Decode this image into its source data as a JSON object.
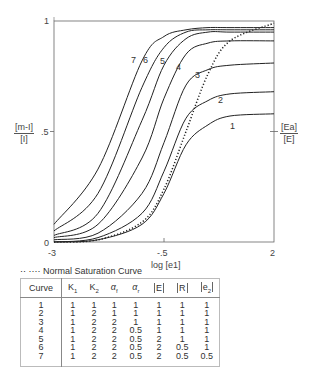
{
  "chart_data": {
    "type": "line",
    "title": "",
    "xlabel": "log [e1]",
    "ylabel_left": "[m-I] / [I]",
    "ylabel_right": "[Ea] / [E]",
    "xlim": [
      -3,
      2
    ],
    "ylim": [
      0,
      1
    ],
    "x_ticks": [
      "-3",
      "-.5",
      "2"
    ],
    "y_ticks": [
      "0",
      ".5",
      "1"
    ],
    "grid": false,
    "legend": {
      "position": "below",
      "entries": [
        "Normal Saturation Curve"
      ]
    },
    "series": [
      {
        "name": "1",
        "style": "solid",
        "x": [
          -3,
          -2,
          -1,
          -0.5,
          0,
          0.5,
          1,
          2
        ],
        "y": [
          0.0,
          0.01,
          0.08,
          0.22,
          0.44,
          0.53,
          0.57,
          0.58
        ]
      },
      {
        "name": "2",
        "style": "solid",
        "x": [
          -3,
          -2,
          -1,
          -0.5,
          0,
          0.5,
          1,
          2
        ],
        "y": [
          0.0,
          0.02,
          0.13,
          0.32,
          0.56,
          0.64,
          0.67,
          0.68
        ]
      },
      {
        "name": "3",
        "style": "solid",
        "x": [
          -3,
          -2,
          -1,
          -0.5,
          0,
          0.5,
          1,
          2
        ],
        "y": [
          0.01,
          0.04,
          0.22,
          0.45,
          0.71,
          0.78,
          0.8,
          0.81
        ]
      },
      {
        "name": "4",
        "style": "solid",
        "x": [
          -3,
          -2,
          -1,
          -0.5,
          0,
          0.5,
          1,
          2
        ],
        "y": [
          0.02,
          0.08,
          0.38,
          0.65,
          0.85,
          0.9,
          0.91,
          0.91
        ]
      },
      {
        "name": "5",
        "style": "solid",
        "x": [
          -3,
          -2,
          -1,
          -0.5,
          0,
          0.5,
          1,
          2
        ],
        "y": [
          0.03,
          0.13,
          0.55,
          0.8,
          0.92,
          0.95,
          0.95,
          0.95
        ]
      },
      {
        "name": "6",
        "style": "solid",
        "x": [
          -3,
          -2,
          -1,
          -0.5,
          0,
          0.5,
          1,
          2
        ],
        "y": [
          0.05,
          0.22,
          0.7,
          0.88,
          0.95,
          0.96,
          0.96,
          0.96
        ]
      },
      {
        "name": "7",
        "style": "solid",
        "x": [
          -3,
          -2,
          -1,
          -0.5,
          0,
          0.5,
          1,
          2
        ],
        "y": [
          0.08,
          0.33,
          0.82,
          0.93,
          0.96,
          0.97,
          0.97,
          0.97
        ]
      },
      {
        "name": "Normal Saturation Curve",
        "style": "dotted",
        "x": [
          -3,
          -2,
          -1,
          -0.5,
          0,
          0.5,
          1,
          2
        ],
        "y": [
          0.0,
          0.01,
          0.09,
          0.24,
          0.5,
          0.76,
          0.91,
          0.99
        ]
      }
    ],
    "curve_labels": [
      "1",
      "2",
      "3",
      "4",
      "5",
      "6",
      "7"
    ]
  },
  "axes": {
    "y_left_num": "[m-I]",
    "y_left_den": "[I]",
    "y_right_num": "[Ea]",
    "y_right_den": "[E]",
    "x_label": "log [e1]",
    "y_tick_0": "0",
    "y_tick_05": ".5",
    "y_tick_1": "1",
    "x_tick_left": "-3",
    "x_tick_mid": "-.5",
    "x_tick_right": "2"
  },
  "legend": {
    "marker": "·· ····",
    "label": "Normal Saturation Curve"
  },
  "table": {
    "headers": [
      "Curve",
      "K1",
      "K2",
      "αf",
      "αr",
      "[E]",
      "[R]",
      "[e2]"
    ],
    "rows": [
      [
        "1",
        "1",
        "1",
        "1",
        "1",
        "1",
        "1",
        "1"
      ],
      [
        "2",
        "1",
        "2",
        "1",
        "1",
        "1",
        "1",
        "1"
      ],
      [
        "3",
        "1",
        "2",
        "2",
        "1",
        "1",
        "1",
        "1"
      ],
      [
        "4",
        "1",
        "2",
        "2",
        "0.5",
        "1",
        "1",
        "1"
      ],
      [
        "5",
        "1",
        "2",
        "2",
        "0.5",
        "2",
        "1",
        "1"
      ],
      [
        "6",
        "1",
        "2",
        "2",
        "0.5",
        "2",
        "0.5",
        "1"
      ],
      [
        "7",
        "1",
        "2",
        "2",
        "0.5",
        "2",
        "0.5",
        "0.5"
      ]
    ]
  }
}
